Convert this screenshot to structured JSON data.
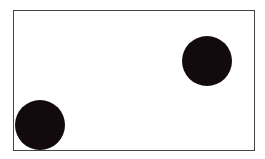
{
  "diagram": {
    "frame": {
      "x": 13,
      "y": 10,
      "width": 241,
      "height": 140,
      "border_color": "#444444"
    },
    "circles": [
      {
        "id": "circle-top-right",
        "cx": 207,
        "cy": 61,
        "r": 25,
        "color": "#120a0d"
      },
      {
        "id": "circle-bottom-left",
        "cx": 40,
        "cy": 125,
        "r": 25,
        "color": "#120a0d"
      }
    ]
  }
}
